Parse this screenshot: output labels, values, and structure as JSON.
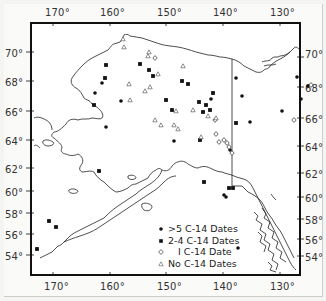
{
  "map": {
    "region": "Alaska",
    "longitude_labels_top": [
      "170°",
      "160°",
      "150°",
      "140°",
      "130°"
    ],
    "longitude_labels_bottom": [
      "170°",
      "160°",
      "150°",
      "140°",
      "130°"
    ],
    "latitude_labels_left": [
      "70°",
      "68°",
      "66°",
      "64°",
      "62°",
      "60°",
      "58°",
      "56°",
      "54°"
    ],
    "latitude_labels_right": [
      "70°",
      "68°",
      "66°",
      "64°",
      "62°",
      "60°",
      "58°",
      "56°",
      "54°"
    ]
  },
  "legend": {
    "items": [
      {
        "symbol": "filled-circle",
        "label": ">5 C-14 Dates"
      },
      {
        "symbol": "filled-square",
        "label": "2-4 C-14 Dates"
      },
      {
        "symbol": "open-diamond",
        "label": "I C-14 Date"
      },
      {
        "symbol": "open-triangle",
        "label": "No C-14 Dates"
      }
    ]
  },
  "sites": {
    "filled_circle": [
      [
        102,
        83
      ],
      [
        95,
        93
      ],
      [
        121,
        101
      ],
      [
        106,
        127
      ],
      [
        174,
        141
      ],
      [
        211,
        99
      ],
      [
        242,
        96
      ],
      [
        236,
        78
      ],
      [
        230,
        150
      ],
      [
        250,
        122
      ],
      [
        297,
        77
      ],
      [
        308,
        86
      ],
      [
        301,
        99
      ],
      [
        282,
        111
      ],
      [
        226,
        197
      ],
      [
        238,
        248
      ],
      [
        224,
        195
      ]
    ],
    "filled_square": [
      [
        106,
        65
      ],
      [
        94,
        105
      ],
      [
        149,
        70
      ],
      [
        153,
        76
      ],
      [
        182,
        81
      ],
      [
        188,
        84
      ],
      [
        210,
        110
      ],
      [
        229,
        188
      ],
      [
        203,
        112
      ],
      [
        213,
        93
      ],
      [
        236,
        123
      ],
      [
        166,
        100
      ],
      [
        172,
        110
      ],
      [
        199,
        102
      ],
      [
        105,
        78
      ],
      [
        206,
        105
      ],
      [
        200,
        140
      ],
      [
        140,
        64
      ],
      [
        204,
        182
      ],
      [
        99,
        171
      ],
      [
        49,
        221
      ],
      [
        56,
        227
      ],
      [
        37,
        249
      ],
      [
        233,
        188
      ]
    ],
    "open_diamond": [
      [
        155,
        58
      ],
      [
        215,
        120
      ],
      [
        224,
        140
      ],
      [
        219,
        142
      ],
      [
        229,
        147
      ],
      [
        232,
        153
      ],
      [
        311,
        85
      ],
      [
        216,
        134
      ],
      [
        227,
        143
      ],
      [
        294,
        120
      ]
    ],
    "open_triangle": [
      [
        123,
        39
      ],
      [
        124,
        47
      ],
      [
        148,
        56
      ],
      [
        158,
        74
      ],
      [
        129,
        84
      ],
      [
        145,
        91
      ],
      [
        150,
        87
      ],
      [
        130,
        100
      ],
      [
        176,
        111
      ],
      [
        193,
        110
      ],
      [
        208,
        116
      ],
      [
        216,
        118
      ],
      [
        155,
        120
      ],
      [
        161,
        125
      ],
      [
        174,
        125
      ],
      [
        178,
        129
      ],
      [
        201,
        137
      ],
      [
        149,
        52
      ],
      [
        183,
        66
      ]
    ]
  }
}
